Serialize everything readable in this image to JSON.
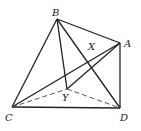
{
  "diagram": {
    "type": "geometry",
    "points": {
      "A": {
        "label": "A",
        "x": 120,
        "y": 43
      },
      "B": {
        "label": "B",
        "x": 57,
        "y": 19
      },
      "C": {
        "label": "C",
        "x": 12,
        "y": 107
      },
      "D": {
        "label": "D",
        "x": 120,
        "y": 108
      },
      "X": {
        "label": "X",
        "x": 91,
        "y": 53
      },
      "Y": {
        "label": "Y",
        "x": 67,
        "y": 89
      }
    },
    "solid_edges": [
      "BA",
      "BC",
      "BD",
      "BY",
      "AC",
      "AD",
      "CD",
      "YA"
    ],
    "dashed_edges": [
      "CY",
      "YD"
    ],
    "line_color": "#222222"
  }
}
